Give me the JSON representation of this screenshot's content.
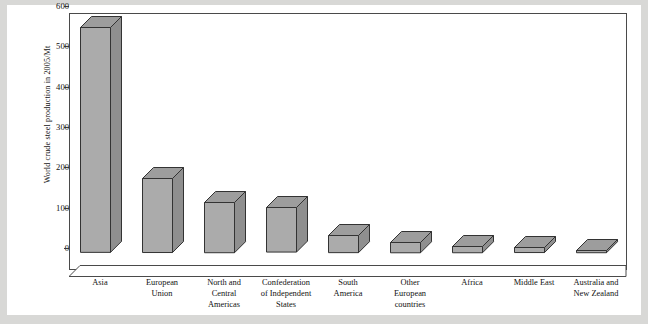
{
  "chart_data": {
    "type": "bar",
    "title": "",
    "subtitle": "",
    "xlabel": "",
    "ylabel": "World crude steel production in 2005/Mt",
    "ylim": [
      0,
      600
    ],
    "yticks": [
      0,
      100,
      200,
      300,
      400,
      500,
      600
    ],
    "ytick_labels": [
      "0",
      "100",
      "200",
      "300",
      "400",
      "500",
      "600"
    ],
    "grid": false,
    "legend": "none",
    "style": "3d-bar",
    "bar_fill_color": "#ababab",
    "bar_top_color": "#9d9d9d",
    "bar_side_color": "#8f8f8f",
    "bar_edge_color": "#333333",
    "background_color": "#ffffff",
    "page_border_color": "#d8d8d6",
    "categories": [
      "Asia",
      "European Union",
      "North and Central Americas",
      "Confederation of Independent States",
      "South America",
      "Other European countries",
      "Africa",
      "Middle East",
      "Australia and New Zealand"
    ],
    "category_lines": [
      [
        "Asia"
      ],
      [
        "European",
        "Union"
      ],
      [
        "North and",
        "Central",
        "Americas"
      ],
      [
        "Confederation",
        "of Independent",
        "States"
      ],
      [
        "South",
        "America"
      ],
      [
        "Other",
        "European",
        "countries"
      ],
      [
        "Africa"
      ],
      [
        "Middle East"
      ],
      [
        "Australia and",
        "New Zealand"
      ]
    ],
    "values": [
      560,
      186,
      127,
      113,
      45,
      28,
      18,
      15,
      8
    ]
  }
}
